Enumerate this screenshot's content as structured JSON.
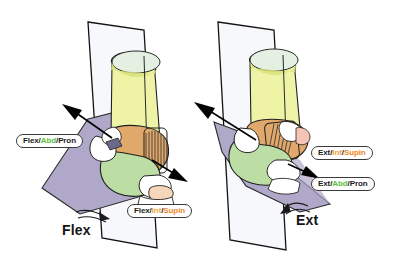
{
  "figure": {
    "background_color": "#ffffff",
    "panels": [
      {
        "id": "left",
        "caption": "Flex",
        "caption_name": "flexion-caption",
        "plane_vertical_color": "#f4f6fb",
        "plane_oblique_color": "#b0a8c8",
        "bone_upper_color": "#e9efa0",
        "bone_mid_color": "#dfa86a",
        "bone_lower_color": "#b8d9a0",
        "ligament_color": "#ffffff",
        "outline_color": "#1a1a1a",
        "labels": [
          {
            "name": "label-flex-abd-pron",
            "segments": [
              {
                "text": "Flex",
                "color_role": "dark"
              },
              {
                "text": "/",
                "color_role": "sep"
              },
              {
                "text": "Abd",
                "color_role": "green"
              },
              {
                "text": "/",
                "color_role": "sep"
              },
              {
                "text": "Pron",
                "color_role": "dark"
              }
            ]
          },
          {
            "name": "label-flex-int-supin",
            "segments": [
              {
                "text": "Flex",
                "color_role": "dark"
              },
              {
                "text": "/",
                "color_role": "sep"
              },
              {
                "text": "Int",
                "color_role": "orange"
              },
              {
                "text": "/",
                "color_role": "sep"
              },
              {
                "text": "Supin",
                "color_role": "supin"
              }
            ]
          }
        ]
      },
      {
        "id": "right",
        "caption": "Ext",
        "caption_name": "extension-caption",
        "plane_vertical_color": "#f4f6fb",
        "plane_oblique_color": "#b0a8c8",
        "bone_upper_color": "#e9efa0",
        "bone_mid_color": "#dfa86a",
        "bone_lower_color": "#b8d9a0",
        "ligament_color": "#ffffff",
        "outline_color": "#1a1a1a",
        "labels": [
          {
            "name": "label-ext-int-supin",
            "segments": [
              {
                "text": "Ext",
                "color_role": "dark"
              },
              {
                "text": "/",
                "color_role": "sep"
              },
              {
                "text": "Int",
                "color_role": "orange"
              },
              {
                "text": "/",
                "color_role": "sep"
              },
              {
                "text": "Supin",
                "color_role": "supin"
              }
            ]
          },
          {
            "name": "label-ext-abd-pron",
            "segments": [
              {
                "text": "Ext",
                "color_role": "dark"
              },
              {
                "text": "/",
                "color_role": "sep"
              },
              {
                "text": "Abd",
                "color_role": "green"
              },
              {
                "text": "/",
                "color_role": "sep"
              },
              {
                "text": "Pron",
                "color_role": "dark"
              }
            ]
          }
        ]
      }
    ],
    "colors": {
      "label_text": "#1b1b1b",
      "label_green": "#5bbf3a",
      "label_orange": "#f0a23c",
      "label_supin": "#f0862a",
      "arrow": "#000000",
      "caption_text": "#161616"
    }
  },
  "labels_flat": {
    "l0": "Flex/Abd/Pron",
    "l1": "Flex/Int/Supin",
    "r0": "Ext/Int/Supin",
    "r1": "Ext/Abd/Pron",
    "cap_left": "Flex",
    "cap_right": "Ext"
  }
}
